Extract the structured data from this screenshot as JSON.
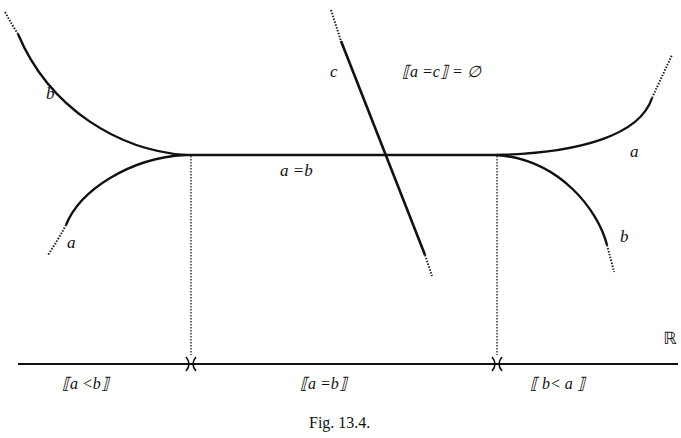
{
  "figure": {
    "caption": "Fig. 13.4.",
    "axis_label": "ℝ",
    "curves": {
      "left_upper": "b",
      "left_lower": "a",
      "right_upper": "a",
      "right_lower": "b",
      "line": "c",
      "middle": "a =b"
    },
    "annotation": "⟦a =c⟧ = ∅",
    "intervals": [
      {
        "label": "⟦a <b⟧"
      },
      {
        "label": "⟦a =b⟧"
      },
      {
        "label": "⟦ b< a ⟧"
      }
    ],
    "colors": {
      "ink": "#111111",
      "background": "#ffffff"
    }
  }
}
